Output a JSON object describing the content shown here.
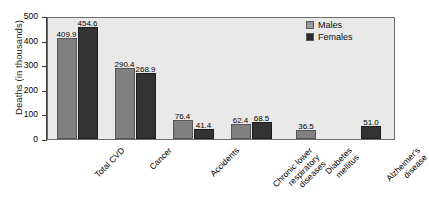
{
  "chart_data": {
    "type": "bar",
    "title": "",
    "xlabel": "",
    "ylabel": "Deaths (in thousands)",
    "ylim": [
      0,
      500
    ],
    "yticks": [
      "0",
      "100",
      "200",
      "300",
      "400",
      "500"
    ],
    "grid": false,
    "legend_position": "top-right",
    "categories": [
      "Total CVD",
      "Cancer",
      "Accidents",
      "Chronic lower respiratory diseases",
      "Diabetes mellitus",
      "Alzheimer's disease"
    ],
    "category_lines": [
      [
        "Total CVD"
      ],
      [
        "Cancer"
      ],
      [
        "Accidents"
      ],
      [
        "Chronic lower",
        "respiratory",
        "diseases"
      ],
      [
        "Diabetes",
        "mellitus"
      ],
      [
        "Alzheimer's",
        "disease"
      ]
    ],
    "series": [
      {
        "name": "Males",
        "color": "#808080",
        "values": [
          409.9,
          290.4,
          76.4,
          62.4,
          36.5,
          null
        ],
        "labels": [
          "409.9",
          "290.4",
          "76.4",
          "62.4",
          "36.5",
          ""
        ]
      },
      {
        "name": "Females",
        "color": "#333333",
        "values": [
          454.6,
          268.9,
          41.4,
          68.5,
          null,
          51.0
        ],
        "labels": [
          "454.6",
          "268.9",
          "41.4",
          "68.5",
          "",
          "51.0"
        ]
      }
    ]
  },
  "legend": {
    "items": [
      {
        "label": "Males",
        "swatch": "males"
      },
      {
        "label": "Females",
        "swatch": "females"
      }
    ]
  },
  "colors": {
    "males": "#808080",
    "females": "#333333",
    "plot_background": "#e9e9e9",
    "axis": "#3a3a3a",
    "page_background": "#ffffff"
  }
}
